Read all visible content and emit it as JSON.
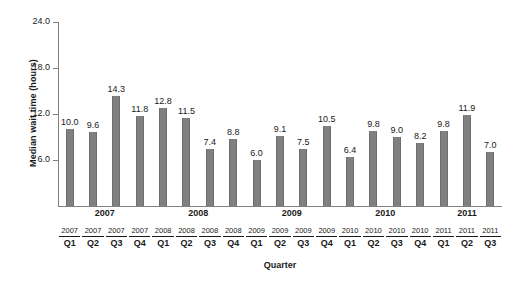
{
  "chart_data": {
    "type": "bar",
    "title": "",
    "xlabel": "Quarter",
    "ylabel": "Median wait time (hours)",
    "ylim": [
      0,
      24
    ],
    "yticks": [
      "6.0",
      "12.0",
      "18.0",
      "24.0"
    ],
    "ytick_values": [
      6.0,
      12.0,
      18.0,
      24.0
    ],
    "grid": false,
    "legend": "none",
    "bar_color": "#808080",
    "categories": [
      "2007 Q1",
      "2007 Q2",
      "2007 Q3",
      "2007 Q4",
      "2008 Q1",
      "2008 Q2",
      "2008 Q3",
      "2008 Q4",
      "2009 Q1",
      "2009 Q2",
      "2009 Q3",
      "2009 Q4",
      "2010 Q1",
      "2010 Q2",
      "2010 Q3",
      "2010 Q4",
      "2011 Q1",
      "2011 Q2",
      "2011 Q3"
    ],
    "values": [
      10.0,
      9.6,
      14.3,
      11.8,
      12.8,
      11.5,
      7.4,
      8.8,
      6.0,
      9.1,
      7.5,
      10.5,
      6.4,
      9.8,
      9.0,
      8.2,
      9.8,
      11.9,
      7.0
    ],
    "value_labels": [
      "10.0",
      "9.6",
      "14.3",
      "11.8",
      "12.8",
      "11.5",
      "7.4",
      "8.8",
      "6.0",
      "9.1",
      "7.5",
      "10.5",
      "6.4",
      "9.8",
      "9.0",
      "8.2",
      "9.8",
      "11.9",
      "7.0"
    ],
    "tick_years": [
      "2007",
      "2007",
      "2007",
      "2007",
      "2008",
      "2008",
      "2008",
      "2008",
      "2009",
      "2009",
      "2009",
      "2009",
      "2010",
      "2010",
      "2010",
      "2010",
      "2011",
      "2011",
      "2011"
    ],
    "tick_quarters": [
      "Q1",
      "Q2",
      "Q3",
      "Q4",
      "Q1",
      "Q2",
      "Q3",
      "Q4",
      "Q1",
      "Q2",
      "Q3",
      "Q4",
      "Q1",
      "Q2",
      "Q3",
      "Q4",
      "Q1",
      "Q2",
      "Q3"
    ],
    "year_groups": [
      {
        "label": "2007",
        "start": 0,
        "count": 4
      },
      {
        "label": "2008",
        "start": 4,
        "count": 4
      },
      {
        "label": "2009",
        "start": 8,
        "count": 4
      },
      {
        "label": "2010",
        "start": 12,
        "count": 4
      },
      {
        "label": "2011",
        "start": 16,
        "count": 3
      }
    ]
  }
}
